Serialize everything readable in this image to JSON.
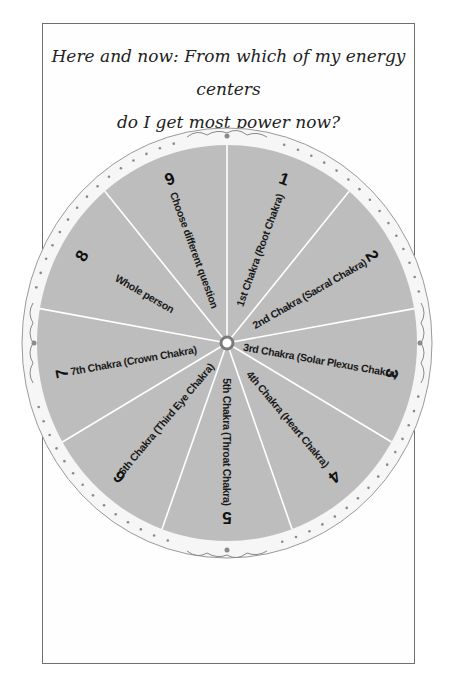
{
  "title": {
    "line1": "Here and now: From which of my energy centers",
    "line2": "do I get most power now?"
  },
  "wheel": {
    "colors": {
      "segment": "#bdbdbd",
      "rim": "#f4f4f4",
      "divider": "#ffffff",
      "ornament": "#8a8a8a",
      "hub": "#7a7a7a"
    },
    "segments": [
      {
        "number": "1",
        "label": "1st Chakra (Root Chakra)"
      },
      {
        "number": "2",
        "label": "2nd Chakra (Sacral Chakra)"
      },
      {
        "number": "3",
        "label": "3rd Chakra (Solar Plexus Chakra)"
      },
      {
        "number": "4",
        "label": "4th Chakra (Heart Chakra)"
      },
      {
        "number": "5",
        "label": "5th Chakra (Throat Chakra)"
      },
      {
        "number": "6",
        "label": "6th Chakra (Third Eye Chakra)"
      },
      {
        "number": "7",
        "label": "7th Chakra (Crown Chakra)"
      },
      {
        "number": "8",
        "label": "Whole person"
      },
      {
        "number": "9",
        "label": "Choose different question"
      }
    ]
  }
}
